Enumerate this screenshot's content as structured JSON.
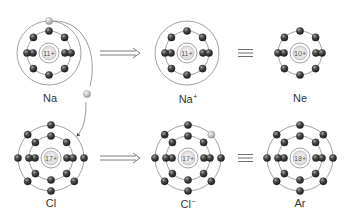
{
  "colors": {
    "shell": "#7a7a7a",
    "electron_dark": "#3a3a3a",
    "electron_light": "#bdbdbd",
    "nucleus_fill": "#e8e8e8",
    "nucleus_text": "#555555",
    "arrow": "#6e6e6e",
    "label": "#333333"
  },
  "atoms": [
    {
      "id": "na",
      "symbol": "Na",
      "charge_sup": "",
      "nucleus": "11+",
      "cx": 49,
      "cy": 53,
      "shells": [
        {
          "r": 22,
          "electrons": 8,
          "tight_pairs": true
        },
        {
          "r": 32,
          "electrons": 0
        }
      ],
      "extra_electrons": [
        {
          "x": 49,
          "y": 21,
          "light": true
        }
      ],
      "label": {
        "x": 50,
        "y": 93
      }
    },
    {
      "id": "na-ion",
      "symbol": "Na",
      "charge_sup": "+",
      "nucleus": "11+",
      "cx": 187,
      "cy": 53,
      "shells": [
        {
          "r": 22,
          "electrons": 8,
          "tight_pairs": true
        },
        {
          "r": 32,
          "electrons": 0
        }
      ],
      "extra_electrons": [],
      "label": {
        "x": 188,
        "y": 93
      }
    },
    {
      "id": "ne",
      "symbol": "Ne",
      "charge_sup": "",
      "nucleus": "10+",
      "cx": 300,
      "cy": 53,
      "shells": [
        {
          "r": 22,
          "electrons": 8,
          "tight_pairs": true
        }
      ],
      "extra_electrons": [],
      "label": {
        "x": 300,
        "y": 93
      }
    },
    {
      "id": "cl",
      "symbol": "Cl",
      "charge_sup": "",
      "nucleus": "17+",
      "cx": 51,
      "cy": 158,
      "shells": [
        {
          "r": 22,
          "electrons": 8,
          "tight_pairs": true
        },
        {
          "r": 33,
          "electrons": 7,
          "tight_pairs": true,
          "missing_index": 1
        }
      ],
      "extra_electrons": [],
      "label": {
        "x": 51,
        "y": 198
      }
    },
    {
      "id": "cl-ion",
      "symbol": "Cl",
      "charge_sup": "−",
      "nucleus": "17+",
      "cx": 188,
      "cy": 158,
      "shells": [
        {
          "r": 22,
          "electrons": 8,
          "tight_pairs": true
        },
        {
          "r": 33,
          "electrons": 8,
          "tight_pairs": true,
          "light_index": 1
        }
      ],
      "extra_electrons": [],
      "label": {
        "x": 188,
        "y": 198
      }
    },
    {
      "id": "ar",
      "symbol": "Ar",
      "charge_sup": "",
      "nucleus": "18+",
      "cx": 300,
      "cy": 158,
      "shells": [
        {
          "r": 22,
          "electrons": 8,
          "tight_pairs": true
        },
        {
          "r": 33,
          "electrons": 8,
          "tight_pairs": true
        }
      ],
      "extra_electrons": [],
      "label": {
        "x": 300,
        "y": 198
      }
    }
  ],
  "operators": [
    {
      "type": "implies",
      "x1": 100,
      "x2": 140,
      "y": 53
    },
    {
      "type": "equiv",
      "x1": 238,
      "x2": 253,
      "y": 53
    },
    {
      "type": "implies",
      "x1": 100,
      "x2": 140,
      "y": 158
    },
    {
      "type": "equiv",
      "x1": 238,
      "x2": 253,
      "y": 158
    }
  ],
  "transfer": {
    "path": "M 53 21 C 85 20, 98 55, 90 86",
    "path2": "M 86 102 C 86 118, 84 128, 77 136",
    "electron": {
      "x": 87,
      "y": 94
    }
  }
}
